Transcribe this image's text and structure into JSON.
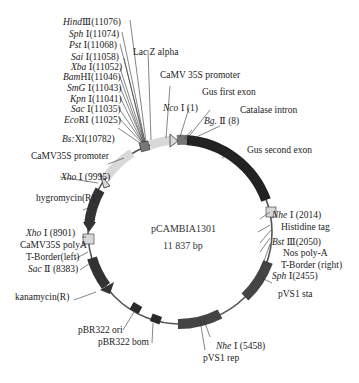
{
  "plasmid": {
    "name": "pCAMBIA1301",
    "size_label": "11 837  bp"
  },
  "restriction_sites": [
    {
      "enzyme_italic": "Hind",
      "suffix": "Ⅲ",
      "pos": "(11076)"
    },
    {
      "enzyme_italic": "Sph",
      "suffix": "Ⅰ",
      "pos": "(11074)"
    },
    {
      "enzyme_italic": "Pst",
      "suffix": "Ⅰ",
      "pos": "(11068)"
    },
    {
      "enzyme_italic": "Sai",
      "suffix": "Ⅰ",
      "pos": "(11058)"
    },
    {
      "enzyme_italic": "Xba",
      "suffix": "Ⅰ",
      "pos": "(11052)"
    },
    {
      "enzyme_italic": "Bam",
      "suffix": "HⅠ",
      "pos": "(11046)"
    },
    {
      "enzyme_italic": "SmG",
      "suffix": "Ⅰ",
      "pos": "(11043)"
    },
    {
      "enzyme_italic": "Kpn",
      "suffix": "Ⅰ",
      "pos": "(11041)"
    },
    {
      "enzyme_italic": "Sac",
      "suffix": "Ⅰ",
      "pos": "(11035)"
    },
    {
      "enzyme_italic": "Eco",
      "suffix": "RⅠ",
      "pos": "(11025)"
    },
    {
      "enzyme_italic": "Bs:",
      "suffix": "XI",
      "pos": "(10782)"
    },
    {
      "enzyme_italic": "Xho",
      "suffix": "Ⅰ",
      "pos": "(9995)"
    },
    {
      "enzyme_italic": "Nco",
      "suffix": "Ⅰ",
      "pos": "(1)"
    },
    {
      "enzyme_italic": "Bg.",
      "suffix": "Ⅱ",
      "pos": "(8)"
    },
    {
      "enzyme_italic": "Nhe",
      "suffix": "Ⅰ",
      "pos": "(2014)"
    },
    {
      "enzyme_italic": "Bst",
      "suffix": "Ⅲ",
      "pos": "(2050)"
    },
    {
      "enzyme_italic": "Sph",
      "suffix": "Ⅰ",
      "pos": "(2455)"
    },
    {
      "enzyme_italic": "Xho",
      "suffix": "Ⅰ",
      "pos": "(8901)"
    },
    {
      "enzyme_italic": "Sac",
      "suffix": "Ⅱ",
      "pos": "(8383)"
    },
    {
      "enzyme_italic": "Nhe",
      "suffix": "Ⅰ",
      "pos": "(5458)"
    }
  ],
  "features": {
    "lacz": "Lac  Z  alpha",
    "camv35s_top": "CaMV  35S  promoter",
    "gus_first": "Gus  first  exon",
    "catalase": "Catalase  intron",
    "gus_second": "Gus  second  exon",
    "histidine": "Histidine  tag",
    "nos": "Nos poly-A",
    "tborder_right": "T-Border (right)",
    "camv35s_left": "CaMV35S  promoter",
    "hygro": "hygromycin(R)",
    "camv_polya": "CaMV35S  polyA",
    "tborder_left": "T-Border(left)",
    "kana": "kanamycin(R)",
    "pbr_ori": "pBR322  ori",
    "pbr_bom": "pBR322  bom",
    "pvs1_sta": "pVS1  sta",
    "pvs1_rep": "pVS1  rep"
  },
  "colors": {
    "backbone": "#555555",
    "dark_feature": "#2a2a2a",
    "mid_feature": "#6a6a6a",
    "light_feature": "#d8d8d8",
    "text": "#222222"
  }
}
